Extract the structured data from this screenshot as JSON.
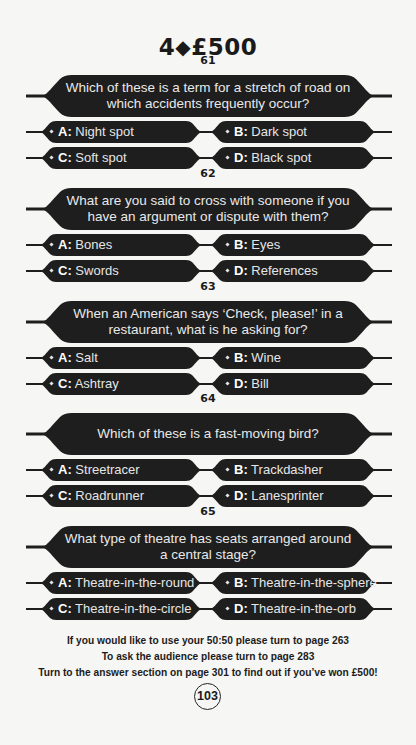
{
  "header": {
    "level": "4",
    "diamond_icon": "diamond",
    "prize": "£500"
  },
  "colors": {
    "banner": "#1e1e1e",
    "banner_text": "#e9e9e9",
    "page_bg": "#f6f6f4"
  },
  "questions": [
    {
      "number": "61",
      "text": "Which of these is a term for a stretch of road on which accidents frequently occur?",
      "answers": [
        {
          "letter": "A:",
          "text": "Night spot"
        },
        {
          "letter": "B:",
          "text": "Dark spot"
        },
        {
          "letter": "C:",
          "text": "Soft spot"
        },
        {
          "letter": "D:",
          "text": "Black spot"
        }
      ]
    },
    {
      "number": "62",
      "text": "What are you said to cross with someone if you have an argument or dispute with them?",
      "answers": [
        {
          "letter": "A:",
          "text": "Bones"
        },
        {
          "letter": "B:",
          "text": "Eyes"
        },
        {
          "letter": "C:",
          "text": "Swords"
        },
        {
          "letter": "D:",
          "text": "References"
        }
      ]
    },
    {
      "number": "63",
      "text": "When an American says ‘Check, please!’ in a restaurant, what is he asking for?",
      "answers": [
        {
          "letter": "A:",
          "text": "Salt"
        },
        {
          "letter": "B:",
          "text": "Wine"
        },
        {
          "letter": "C:",
          "text": "Ashtray"
        },
        {
          "letter": "D:",
          "text": "Bill"
        }
      ]
    },
    {
      "number": "64",
      "text": "Which of these is a fast-moving bird?",
      "answers": [
        {
          "letter": "A:",
          "text": "Streetracer"
        },
        {
          "letter": "B:",
          "text": "Trackdasher"
        },
        {
          "letter": "C:",
          "text": "Roadrunner"
        },
        {
          "letter": "D:",
          "text": "Lanesprinter"
        }
      ]
    },
    {
      "number": "65",
      "text": "What type of theatre has seats arranged around a central stage?",
      "answers": [
        {
          "letter": "A:",
          "text": "Theatre-in-the-round"
        },
        {
          "letter": "B:",
          "text": "Theatre-in-the-sphere"
        },
        {
          "letter": "C:",
          "text": "Theatre-in-the-circle"
        },
        {
          "letter": "D:",
          "text": "Theatre-in-the-orb"
        }
      ]
    }
  ],
  "footer": {
    "line1": "If you would like to use your 50:50 please turn to page 263",
    "line2": "To ask the audience please turn to page 283",
    "line3": "Turn to the answer section on page 301 to find out if you’ve won £500!"
  },
  "page_number": "103"
}
